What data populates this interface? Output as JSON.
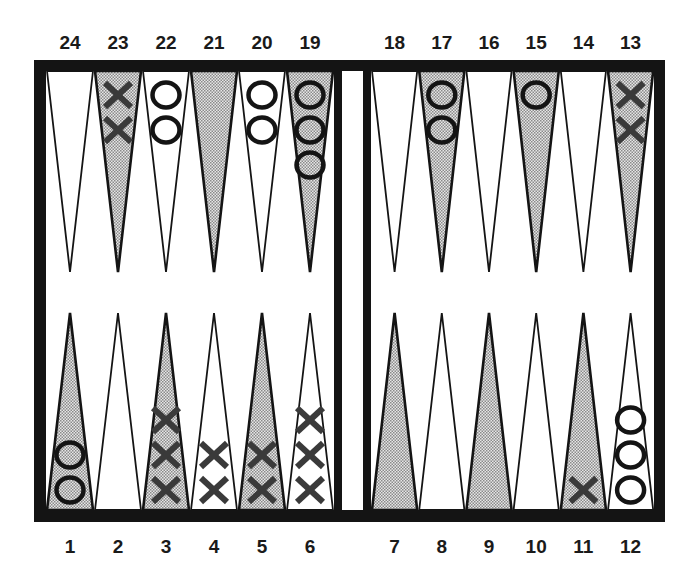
{
  "colors": {
    "frame": "#141414",
    "point_dark_fill": "#c8c8c8",
    "point_light_fill": "#ffffff",
    "x_piece": "#3a3a3a",
    "o_piece": "#141414",
    "background": "#ffffff"
  },
  "board": {
    "top_labels": [
      "24",
      "23",
      "22",
      "21",
      "20",
      "19",
      "18",
      "17",
      "16",
      "15",
      "14",
      "13"
    ],
    "bottom_labels": [
      "1",
      "2",
      "3",
      "4",
      "5",
      "6",
      "7",
      "8",
      "9",
      "10",
      "11",
      "12"
    ],
    "points": [
      {
        "number": 1,
        "row": "bottom",
        "shade": "dark",
        "checker": "O",
        "count": 2
      },
      {
        "number": 2,
        "row": "bottom",
        "shade": "light",
        "checker": "",
        "count": 0
      },
      {
        "number": 3,
        "row": "bottom",
        "shade": "dark",
        "checker": "X",
        "count": 3
      },
      {
        "number": 4,
        "row": "bottom",
        "shade": "light",
        "checker": "X",
        "count": 2
      },
      {
        "number": 5,
        "row": "bottom",
        "shade": "dark",
        "checker": "X",
        "count": 2
      },
      {
        "number": 6,
        "row": "bottom",
        "shade": "light",
        "checker": "X",
        "count": 3
      },
      {
        "number": 7,
        "row": "bottom",
        "shade": "dark",
        "checker": "",
        "count": 0
      },
      {
        "number": 8,
        "row": "bottom",
        "shade": "light",
        "checker": "",
        "count": 0
      },
      {
        "number": 9,
        "row": "bottom",
        "shade": "dark",
        "checker": "",
        "count": 0
      },
      {
        "number": 10,
        "row": "bottom",
        "shade": "light",
        "checker": "",
        "count": 0
      },
      {
        "number": 11,
        "row": "bottom",
        "shade": "dark",
        "checker": "X",
        "count": 1
      },
      {
        "number": 12,
        "row": "bottom",
        "shade": "light",
        "checker": "O",
        "count": 3
      },
      {
        "number": 13,
        "row": "top",
        "shade": "dark",
        "checker": "X",
        "count": 2
      },
      {
        "number": 14,
        "row": "top",
        "shade": "light",
        "checker": "",
        "count": 0
      },
      {
        "number": 15,
        "row": "top",
        "shade": "dark",
        "checker": "O",
        "count": 1
      },
      {
        "number": 16,
        "row": "top",
        "shade": "light",
        "checker": "",
        "count": 0
      },
      {
        "number": 17,
        "row": "top",
        "shade": "dark",
        "checker": "O",
        "count": 2
      },
      {
        "number": 18,
        "row": "top",
        "shade": "light",
        "checker": "",
        "count": 0
      },
      {
        "number": 19,
        "row": "top",
        "shade": "dark",
        "checker": "O",
        "count": 3
      },
      {
        "number": 20,
        "row": "top",
        "shade": "light",
        "checker": "O",
        "count": 2
      },
      {
        "number": 21,
        "row": "top",
        "shade": "dark",
        "checker": "",
        "count": 0
      },
      {
        "number": 22,
        "row": "top",
        "shade": "light",
        "checker": "O",
        "count": 2
      },
      {
        "number": 23,
        "row": "top",
        "shade": "dark",
        "checker": "X",
        "count": 2
      },
      {
        "number": 24,
        "row": "top",
        "shade": "light",
        "checker": "",
        "count": 0
      }
    ]
  }
}
